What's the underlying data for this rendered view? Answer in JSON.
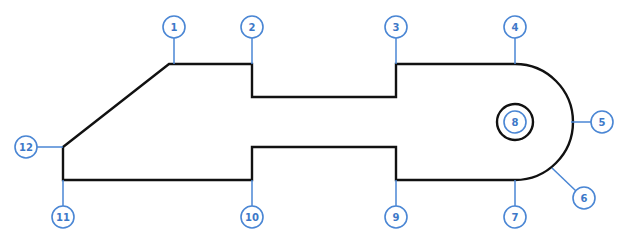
{
  "diagram": {
    "type": "part-outline-with-numbered-callouts",
    "colors": {
      "outline": "#111111",
      "callout": "#4a86d4",
      "callout_text": "#3d78c8"
    },
    "callouts": [
      {
        "id": "1",
        "label": "1"
      },
      {
        "id": "2",
        "label": "2"
      },
      {
        "id": "3",
        "label": "3"
      },
      {
        "id": "4",
        "label": "4"
      },
      {
        "id": "5",
        "label": "5"
      },
      {
        "id": "6",
        "label": "6"
      },
      {
        "id": "7",
        "label": "7"
      },
      {
        "id": "8",
        "label": "8"
      },
      {
        "id": "9",
        "label": "9"
      },
      {
        "id": "10",
        "label": "10"
      },
      {
        "id": "11",
        "label": "11"
      },
      {
        "id": "12",
        "label": "12"
      }
    ]
  }
}
